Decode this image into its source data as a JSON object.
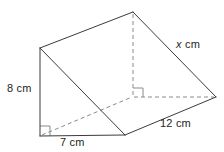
{
  "figure": {
    "type": "triangular-prism",
    "colors": {
      "visible_edge": "#3b3b3b",
      "hidden_edge": "#8a8a8a",
      "right_angle_mark": "#8a8a8a",
      "label_text": "#231f20",
      "background": "#ffffff"
    },
    "labels": {
      "height": "8 cm",
      "base": "7 cm",
      "depth": "12 cm",
      "slant_value": "x",
      "slant_unit": " cm"
    },
    "measurements": {
      "height_cm": 8,
      "base_cm": 7,
      "depth_cm": 12,
      "slant_cm": "x"
    },
    "vertices": {
      "apex_top": [
        133,
        12
      ],
      "front_top_left": [
        40,
        48
      ],
      "right_far": [
        216,
        97
      ],
      "front_bottom_left": [
        40,
        136
      ],
      "front_bottom_right": [
        125,
        135
      ],
      "hidden_back_corner": [
        133,
        97
      ]
    },
    "right_angles": [
      {
        "name": "front-bottom-left-right-angle",
        "at": [
          40,
          136
        ]
      },
      {
        "name": "interior-hidden-right-angle",
        "at": [
          133,
          97
        ]
      }
    ]
  }
}
